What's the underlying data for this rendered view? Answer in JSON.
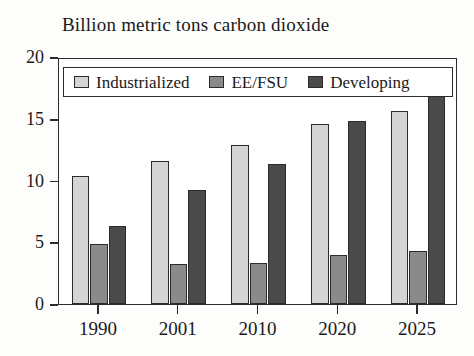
{
  "chart_data": {
    "type": "bar",
    "title": "Billion metric tons carbon dioxide",
    "xlabel": "",
    "ylabel": "",
    "categories": [
      "1990",
      "2001",
      "2010",
      "2020",
      "2025"
    ],
    "series": [
      {
        "name": "Industrialized",
        "color": "#d4d4d4",
        "values": [
          10.4,
          11.6,
          12.9,
          14.6,
          15.6
        ]
      },
      {
        "name": "EE/FSU",
        "color": "#8a8a8a",
        "values": [
          4.9,
          3.2,
          3.3,
          4.0,
          4.3
        ]
      },
      {
        "name": "Developing",
        "color": "#4a4a4a",
        "values": [
          6.3,
          9.2,
          11.3,
          14.8,
          17.0
        ]
      }
    ],
    "ylim": [
      0,
      20
    ],
    "yticks": [
      0,
      5,
      10,
      15,
      20
    ],
    "ytick_labels": [
      "0",
      "5",
      "10",
      "15",
      "20"
    ],
    "grid": false,
    "legend_position": "upper-left-inside"
  },
  "axis": {
    "y_tick_labels": [
      "20",
      "15",
      "10",
      "5",
      "0"
    ],
    "x_tick_labels": [
      "1990",
      "2001",
      "2010",
      "2020",
      "2025"
    ]
  },
  "legend": {
    "entries": [
      {
        "label": "Industrialized",
        "swatch": "#d4d4d4"
      },
      {
        "label": "EE/FSU",
        "swatch": "#8a8a8a"
      },
      {
        "label": "Developing",
        "swatch": "#4a4a4a"
      }
    ]
  }
}
